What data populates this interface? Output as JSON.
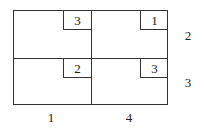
{
  "table": {
    "rows": [
      {
        "cells": [
          {
            "cost": "3"
          },
          {
            "cost": "1"
          }
        ],
        "supply": "2"
      },
      {
        "cells": [
          {
            "cost": "2"
          },
          {
            "cost": "3"
          }
        ],
        "supply": "3"
      }
    ],
    "demands": [
      "1",
      "4"
    ]
  }
}
